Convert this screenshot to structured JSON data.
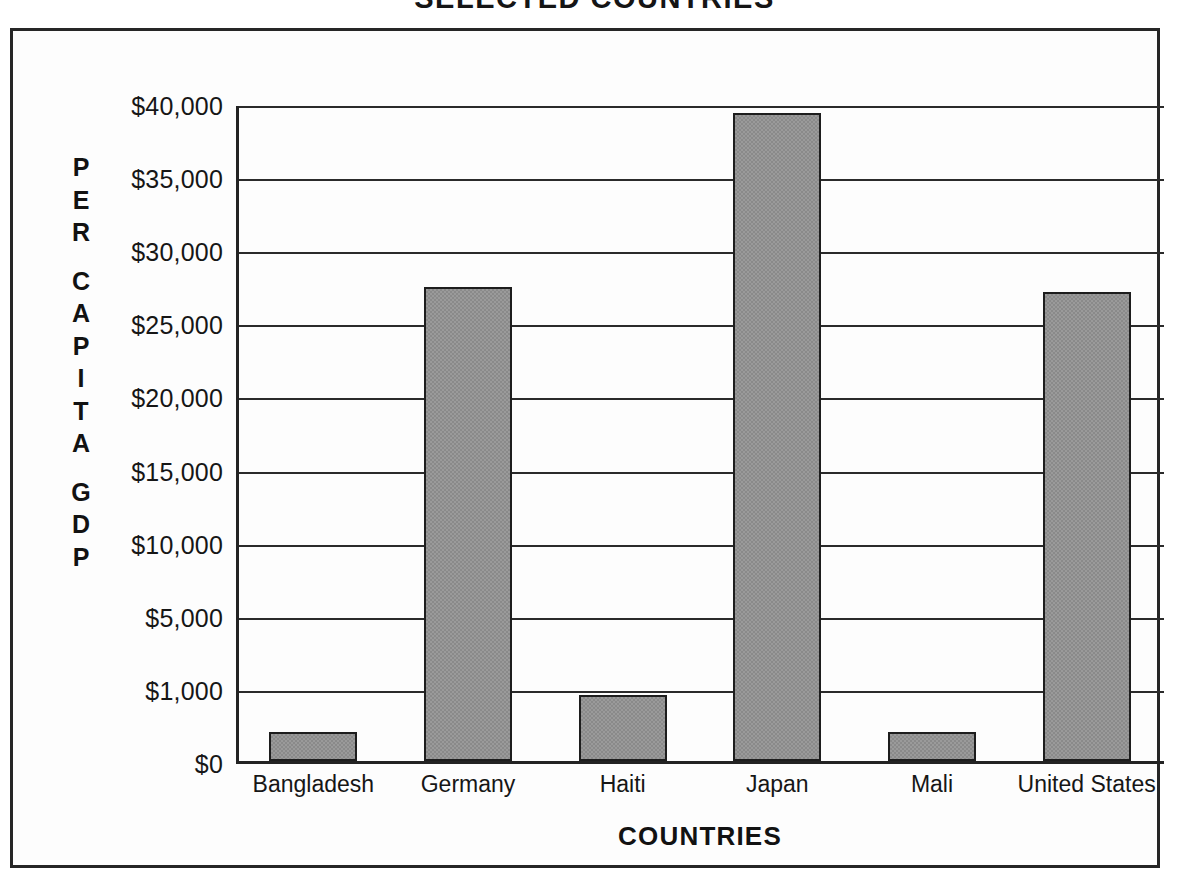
{
  "chart_data": {
    "type": "bar",
    "title": "SELECTED COUNTRIES",
    "xlabel": "COUNTRIES",
    "ylabel": "PER CAPITA GDP",
    "categories": [
      "Bangladesh",
      "Germany",
      "Haiti",
      "Japan",
      "Mali",
      "United States"
    ],
    "values": [
      400,
      27400,
      900,
      39300,
      400,
      27100
    ],
    "ytick_labels": [
      "$40,000",
      "$35,000",
      "$30,000",
      "$25,000",
      "$20,000",
      "$15,000",
      "$10,000",
      "$5,000",
      "$1,000",
      "$0"
    ],
    "ytick_values": [
      40000,
      35000,
      30000,
      25000,
      20000,
      15000,
      10000,
      5000,
      1000,
      0
    ],
    "ylim": [
      0,
      40000
    ],
    "grid": true,
    "legend": false,
    "bar_color": "#9a9a9a",
    "bar_border_color": "#1d1d1d",
    "axis_color": "#232323"
  },
  "ylabel_letters": {
    "line1": [
      "P",
      "E",
      "R"
    ],
    "line2": [
      "C",
      "A",
      "P",
      "I",
      "T",
      "A"
    ],
    "line3": [
      "G",
      "D",
      "P"
    ]
  }
}
